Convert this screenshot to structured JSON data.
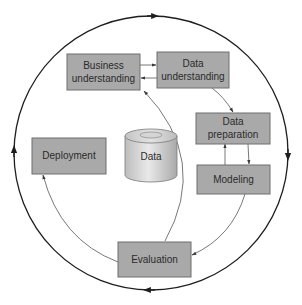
{
  "diagram": {
    "colors": {
      "box_fill": "#a9a9a9",
      "box_stroke": "#6e6e6e",
      "ring_stroke": "#1e1e1e",
      "arrow_stroke": "#555555",
      "text": "#2b2b2b"
    },
    "center": {
      "label": "Data",
      "shape": "cylinder"
    },
    "phases": [
      {
        "id": "business",
        "line1": "Business",
        "line2": "understanding"
      },
      {
        "id": "data-understanding",
        "line1": "Data",
        "line2": "understanding"
      },
      {
        "id": "data-preparation",
        "line1": "Data",
        "line2": "preparation"
      },
      {
        "id": "modeling",
        "line1": "Modeling",
        "line2": ""
      },
      {
        "id": "evaluation",
        "line1": "Evaluation",
        "line2": ""
      },
      {
        "id": "deployment",
        "line1": "Deployment",
        "line2": ""
      }
    ],
    "flows": [
      {
        "from": "Business understanding",
        "to": "Data understanding"
      },
      {
        "from": "Data understanding",
        "to": "Business understanding"
      },
      {
        "from": "Data understanding",
        "to": "Data preparation"
      },
      {
        "from": "Data preparation",
        "to": "Modeling"
      },
      {
        "from": "Modeling",
        "to": "Data preparation"
      },
      {
        "from": "Modeling",
        "to": "Evaluation"
      },
      {
        "from": "Evaluation",
        "to": "Business understanding"
      },
      {
        "from": "Evaluation",
        "to": "Deployment"
      }
    ],
    "outer_cycle": {
      "direction": "clockwise",
      "arrowheads": [
        "top",
        "right",
        "bottom",
        "left"
      ]
    }
  }
}
